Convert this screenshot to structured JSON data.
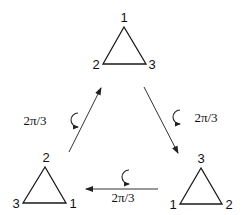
{
  "diagram": {
    "colors": {
      "stroke": "#1a1a1a",
      "text": "#111111",
      "background": "#ffffff"
    },
    "triangles": [
      {
        "id": "top",
        "apex_label": "1",
        "left_label": "2",
        "right_label": "3"
      },
      {
        "id": "bottom-right",
        "apex_label": "3",
        "left_label": "1",
        "right_label": "2"
      },
      {
        "id": "bottom-left",
        "apex_label": "2",
        "left_label": "3",
        "right_label": "1"
      }
    ],
    "arrows": [
      {
        "id": "top-to-bottom-right",
        "label": "2π/3",
        "icon": "counterclockwise-rotation-icon"
      },
      {
        "id": "bottom-right-to-bottom-left",
        "label": "2π/3",
        "icon": "counterclockwise-rotation-icon"
      },
      {
        "id": "bottom-left-to-top",
        "label": "2π/3",
        "icon": "counterclockwise-rotation-icon"
      }
    ]
  }
}
